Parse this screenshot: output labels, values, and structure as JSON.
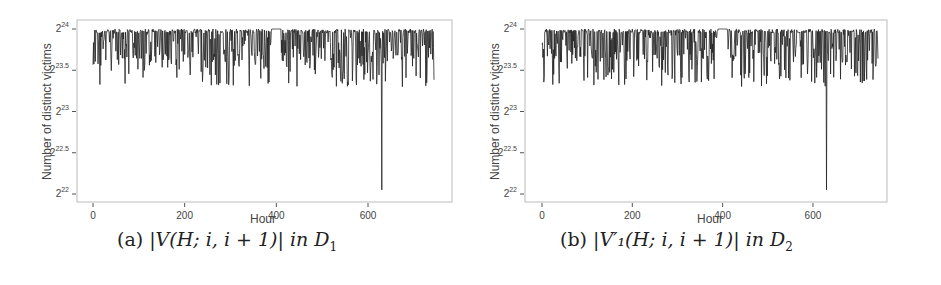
{
  "figure": {
    "panels": [
      {
        "id": "a",
        "caption_prefix": "(a)",
        "caption_math": "|V(H; i, i + 1)| in D",
        "caption_subscript": "1",
        "ylabel": "Number of distinct victims",
        "xlabel": "Hour"
      },
      {
        "id": "b",
        "caption_prefix": "(b)",
        "caption_math": "|V′₁(H; i, i + 1)| in D",
        "caption_subscript": "2",
        "ylabel": "Number of distinct victims",
        "xlabel": "Hour"
      }
    ]
  },
  "chart_data": [
    {
      "type": "line",
      "title": "(a) |V(H;i,i+1)| in D1",
      "xlabel": "Hour",
      "ylabel": "Number of distinct victims",
      "xlim": [
        0,
        744
      ],
      "ylim_log2": [
        22,
        24
      ],
      "x_ticks": [
        0,
        200,
        400,
        600
      ],
      "y_ticks": [
        "2^22",
        "2^22.5",
        "2^23",
        "2^23.5",
        "2^24"
      ],
      "grid": false,
      "description": "Hourly series fluctuating mostly between 2^23.3 and 2^24; flat segment at 2^24 around hours 390-410; single sharp dip to ~2^22.05 at hour ~630",
      "min_point": {
        "x": 630,
        "y_log2": 22.05
      },
      "typical_range_log2": [
        23.3,
        24
      ]
    },
    {
      "type": "line",
      "title": "(b) |V'1(H;i,i+1)| in D2",
      "xlabel": "Hour",
      "ylabel": "Number of distinct victims",
      "xlim": [
        0,
        744
      ],
      "ylim_log2": [
        22,
        24
      ],
      "x_ticks": [
        0,
        200,
        400,
        600
      ],
      "y_ticks": [
        "2^22",
        "2^22.5",
        "2^23",
        "2^23.5",
        "2^24"
      ],
      "grid": false,
      "description": "Nearly identical to (a): values mostly between 2^23.3 and 2^24; flat at 2^24 around hours 390-410; sharp dip to ~2^22.05 at hour ~630",
      "min_point": {
        "x": 630,
        "y_log2": 22.05
      },
      "typical_range_log2": [
        23.3,
        24
      ]
    }
  ]
}
